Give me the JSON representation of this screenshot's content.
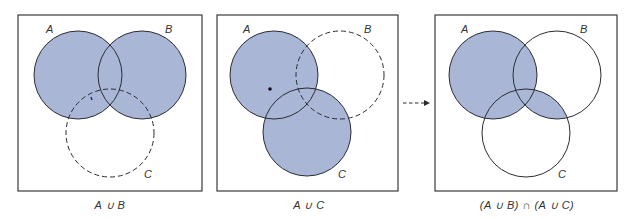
{
  "figure": {
    "fill_color": "#a9b6d6",
    "stroke_color": "#2b2b33",
    "frame_color": "#3a3a3a",
    "arrow": {
      "style": "dashed",
      "direction": "right"
    },
    "panels": [
      {
        "id": "panel-1",
        "caption": "A ∪ B",
        "circles": [
          {
            "label": "A",
            "shaded": true,
            "dashed": false
          },
          {
            "label": "B",
            "shaded": true,
            "dashed": false
          },
          {
            "label": "C",
            "shaded": false,
            "dashed": true
          }
        ],
        "shaded_region": "A ∪ B"
      },
      {
        "id": "panel-2",
        "caption": "A ∪ C",
        "circles": [
          {
            "label": "A",
            "shaded": true,
            "dashed": false
          },
          {
            "label": "B",
            "shaded": false,
            "dashed": true
          },
          {
            "label": "C",
            "shaded": true,
            "dashed": false
          }
        ],
        "shaded_region": "A ∪ C"
      },
      {
        "id": "panel-3",
        "caption": "(A ∪ B) ∩ (A ∪ C)",
        "circles": [
          {
            "label": "A",
            "shaded": true,
            "dashed": false
          },
          {
            "label": "B",
            "shaded": false,
            "dashed": false
          },
          {
            "label": "C",
            "shaded": false,
            "dashed": false
          }
        ],
        "shaded_region": "A ∪ (B ∩ C)"
      }
    ]
  },
  "labels": {
    "a": "A",
    "b": "B",
    "c": "C"
  },
  "captions": {
    "panel1": "A ∪ B",
    "panel2": "A ∪ C",
    "panel3": "(A ∪ B) ∩ (A ∪ C)"
  }
}
